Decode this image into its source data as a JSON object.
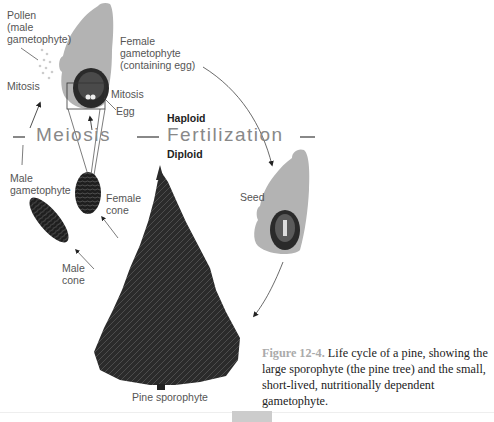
{
  "diagram": {
    "labels": {
      "pollen": "Pollen\n(male\ngametophyte)",
      "female_gametophyte": "Female\ngametophyte\n(containing egg)",
      "mitosis_left": "Mitosis",
      "mitosis_right": "Mitosis",
      "egg": "Egg",
      "haploid": "Haploid",
      "diploid": "Diploid",
      "meiosis": "Meiosis",
      "fertilization": "Fertilization",
      "male_gametophyte": "Male\ngametophyte",
      "female_cone": "Female\ncone",
      "male_cone": "Male\ncone",
      "seed": "Seed",
      "pine_sporophyte": "Pine sporophyte"
    },
    "caption": {
      "figure_number": "Figure 12-4.",
      "text": " Life cycle of a pine, showing the large sporophyte (the pine tree) and the small, short-lived, nutritionally dependent gametophyte."
    },
    "colors": {
      "ovule_gray": "#b3b3b3",
      "dark": "#2a2a2a",
      "label": "#555555",
      "figure_number": "#aaaaaa"
    }
  }
}
